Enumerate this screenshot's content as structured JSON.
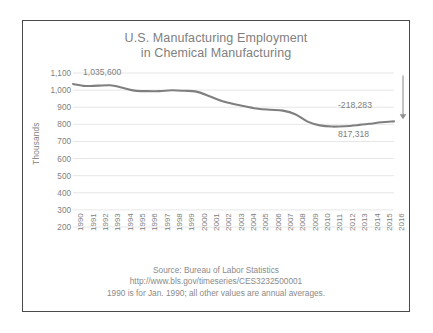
{
  "frame": {
    "border_color": "#4a4a4a",
    "background": "#ffffff"
  },
  "chart_data": {
    "type": "line",
    "title": "U.S. Manufacturing Employment",
    "subtitle": "in Chemical Manufacturing",
    "title_line1": "U.S. Manufacturing Employment",
    "title_line2": "in Chemical Manufacturing",
    "xlabel": "",
    "ylabel": "Thousands",
    "ylim": [
      200,
      1100
    ],
    "ytick_step": 100,
    "grid": true,
    "grid_axis": "y",
    "legend": false,
    "legend_position": "none",
    "line_color": "#7f7f7f",
    "categories": [
      "1990",
      "1991",
      "1992",
      "1993",
      "1994",
      "1995",
      "1996",
      "1997",
      "1998",
      "1999",
      "2000",
      "2001",
      "2002",
      "2003",
      "2004",
      "2005",
      "2006",
      "2007",
      "2008",
      "2009",
      "2010",
      "2011",
      "2012",
      "2013",
      "2014",
      "2015",
      "2016"
    ],
    "ytick_labels": [
      "1,100",
      "1,000",
      "900",
      "800",
      "700",
      "600",
      "500",
      "400",
      "300",
      "200"
    ],
    "ytick_values": [
      1100,
      1000,
      900,
      800,
      700,
      600,
      500,
      400,
      300,
      200
    ],
    "values": [
      1035.6,
      1024.0,
      1026.0,
      1028.0,
      1014.0,
      997.0,
      994.0,
      994.0,
      999.0,
      996.0,
      991.0,
      966.0,
      938.0,
      919.0,
      904.0,
      891.0,
      885.0,
      880.0,
      859.0,
      816.0,
      794.0,
      787.0,
      789.0,
      795.0,
      803.0,
      812.0,
      817.318
    ],
    "series": [
      {
        "name": "Chemical Manufacturing Employment",
        "values": [
          1035.6,
          1024.0,
          1026.0,
          1028.0,
          1014.0,
          997.0,
          994.0,
          994.0,
          999.0,
          996.0,
          991.0,
          966.0,
          938.0,
          919.0,
          904.0,
          891.0,
          885.0,
          880.0,
          859.0,
          816.0,
          794.0,
          787.0,
          789.0,
          795.0,
          803.0,
          812.0,
          817.318
        ]
      }
    ],
    "annotations": [
      {
        "id": "start-value",
        "text": "1,035,600",
        "anchor_year": "1990",
        "value": 1035.6
      },
      {
        "id": "change-value",
        "text": "-218,283",
        "value": -218.283
      },
      {
        "id": "end-value",
        "text": "817,318",
        "anchor_year": "2016",
        "value": 817.318
      }
    ]
  },
  "footer": {
    "line1": "Source: Bureau of Labor Statistics",
    "line2": "http://www.bls.gov/timeseries/CES3232500001",
    "line3": "1990 is for Jan. 1990; all other values are annual averages."
  }
}
